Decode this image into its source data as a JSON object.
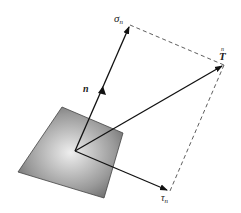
{
  "diagram": {
    "labels": {
      "sigma": "σ",
      "sigma_sub": "n",
      "tau": "τ",
      "tau_sub": "n",
      "traction": "T",
      "traction_sup": "n",
      "normal": "n"
    },
    "colors": {
      "stroke": "#111111",
      "plane_dark": "#555555",
      "plane_light": "#e6e6e6"
    }
  }
}
